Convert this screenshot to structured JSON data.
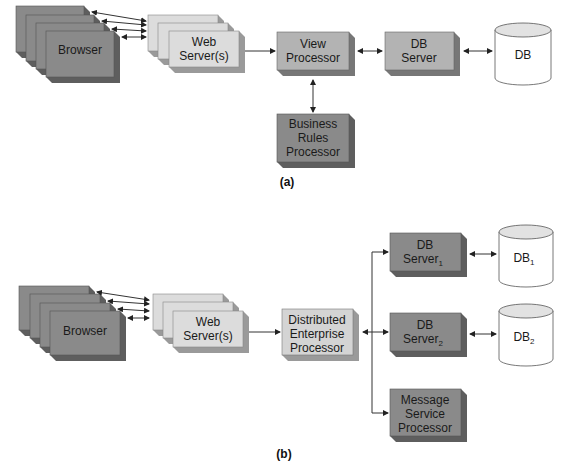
{
  "colors": {
    "dark_box": "#8a8a8a",
    "dark_side": "#5e5e5e",
    "mid_box": "#b3b3b3",
    "mid_side": "#777777",
    "light_box": "#dcdcdc",
    "light_side": "#9a9a9a",
    "db_fill": "#ffffff"
  },
  "diagram_a": {
    "caption": "(a)",
    "browser": "Browser",
    "web_servers": [
      "Web",
      "Server(s)"
    ],
    "view_processor": [
      "View",
      "Processor"
    ],
    "db_server": [
      "DB",
      "Server"
    ],
    "db": "DB",
    "business_rules": [
      "Business",
      "Rules",
      "Processor"
    ]
  },
  "diagram_b": {
    "caption": "(b)",
    "browser": "Browser",
    "web_servers": [
      "Web",
      "Server(s)"
    ],
    "dep": [
      "Distributed",
      "Enterprise",
      "Processor"
    ],
    "db_server_1": [
      "DB",
      "Server",
      "1"
    ],
    "db_server_2": [
      "DB",
      "Server",
      "2"
    ],
    "db_1": [
      "DB",
      "1"
    ],
    "db_2": [
      "DB",
      "2"
    ],
    "message_service": [
      "Message",
      "Service",
      "Processor"
    ]
  }
}
